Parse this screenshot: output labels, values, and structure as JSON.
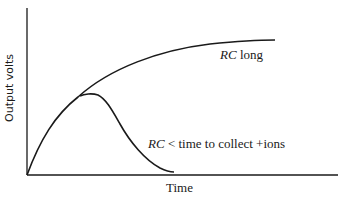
{
  "diagram": {
    "y_axis_label": "Output volts",
    "x_axis_label": "Time",
    "curves": [
      {
        "name": "rc-long",
        "label_italic": "RC",
        "label_rest": " long",
        "description": "Rising exponential saturating curve"
      },
      {
        "name": "rc-short",
        "label_italic": "RC",
        "label_rest": " < time to collect +ions",
        "description": "Rises then peaks and decays toward zero"
      }
    ],
    "colors": {
      "line": "#1a1a1a",
      "background": "#ffffff"
    }
  }
}
